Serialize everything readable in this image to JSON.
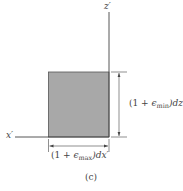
{
  "diagram": {
    "axes": {
      "z_label": "z′",
      "x_label": "x′"
    },
    "element": {
      "fill": "#a8a8a8",
      "stroke": "#555555"
    },
    "dimensions": {
      "vertical": {
        "prefix": "(1 + ",
        "epsilon": "ϵ",
        "sub": "min",
        "suffix": ")dz′"
      },
      "horizontal": {
        "prefix": "(1 + ",
        "epsilon": "ϵ",
        "sub": "max",
        "suffix": ")dx′"
      }
    },
    "caption": "(c)"
  }
}
